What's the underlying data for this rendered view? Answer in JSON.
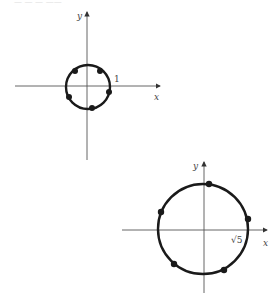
{
  "colors": {
    "ink": "#1a1a1a",
    "axis": "#555555",
    "label": "#444444"
  },
  "figures": [
    {
      "name": "unit-circle",
      "axes": {
        "x_label": "x",
        "y_label": "y"
      },
      "radius_label": "1",
      "center_px": [
        87,
        86
      ],
      "radius_px": 22,
      "points_count": 5
    },
    {
      "name": "sqrt5-circle",
      "axes": {
        "x_label": "x",
        "y_label": "y"
      },
      "radius_label": "√5",
      "center_px": [
        204,
        230
      ],
      "radius_px": 45,
      "points_count": 5
    }
  ]
}
